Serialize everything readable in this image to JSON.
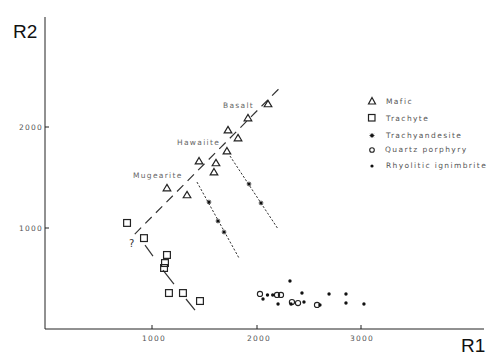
{
  "chart_data": {
    "type": "scatter",
    "title": "",
    "xlabel": "R1",
    "ylabel": "R2",
    "xlim": [
      0,
      3700
    ],
    "ylim": [
      0,
      2950
    ],
    "xticks": [
      1000,
      2000,
      3000
    ],
    "yticks": [
      1000,
      2000
    ],
    "xtick_labels": [
      "1000",
      "2000",
      "3000"
    ],
    "ytick_labels": [
      "1000",
      "2000"
    ],
    "grid": false,
    "legend_position": "upper right",
    "series": [
      {
        "name": "Mafic",
        "marker": "open-triangle",
        "points": [
          [
            2115,
            2228
          ],
          [
            1923,
            2089
          ],
          [
            1732,
            1970
          ],
          [
            1828,
            1891
          ],
          [
            1722,
            1762
          ],
          [
            1455,
            1663
          ],
          [
            1617,
            1644
          ],
          [
            1598,
            1554
          ],
          [
            1148,
            1396
          ],
          [
            1340,
            1327
          ]
        ]
      },
      {
        "name": "Trachyte",
        "marker": "open-square",
        "points": [
          [
            766,
            1050
          ],
          [
            928,
            900
          ],
          [
            1148,
            733
          ],
          [
            1129,
            653
          ],
          [
            1120,
            604
          ],
          [
            1167,
            356
          ],
          [
            1301,
            356
          ],
          [
            1464,
            277
          ]
        ]
      },
      {
        "name": "Trachyandesite",
        "marker": "star",
        "points": [
          [
            1550,
            1257
          ],
          [
            1636,
            1069
          ],
          [
            1694,
            960
          ],
          [
            1933,
            1436
          ],
          [
            2048,
            1248
          ]
        ]
      },
      {
        "name": "Quartz porphyry",
        "marker": "open-circle",
        "points": [
          [
            2038,
            347
          ],
          [
            2201,
            337
          ],
          [
            2239,
            337
          ],
          [
            2344,
            267
          ],
          [
            2402,
            257
          ],
          [
            2584,
            238
          ]
        ]
      },
      {
        "name": "Rhyolitic ignimbrite",
        "marker": "filled-dot",
        "points": [
          [
            2325,
            475
          ],
          [
            2067,
            297
          ],
          [
            2110,
            337
          ],
          [
            2160,
            337
          ],
          [
            2211,
            248
          ],
          [
            2440,
            356
          ],
          [
            2335,
            248
          ],
          [
            2459,
            267
          ],
          [
            2612,
            238
          ],
          [
            2699,
            347
          ],
          [
            2861,
            347
          ],
          [
            2861,
            257
          ],
          [
            3033,
            248
          ]
        ]
      }
    ],
    "trend_lines": [
      {
        "name": "mafic-trend",
        "style": "long-dash",
        "from": [
          840,
          940
        ],
        "to": [
          2230,
          2390
        ]
      },
      {
        "name": "trachyte-trend",
        "style": "long-dash-sparse",
        "segments": [
          [
            [
              938,
              830
            ],
            [
              1014,
              722
            ]
          ],
          [
            [
              1110,
              584
            ],
            [
              1215,
              445
            ]
          ],
          [
            [
              1330,
              297
            ],
            [
              1416,
              188
            ]
          ]
        ]
      },
      {
        "name": "trachyandesite-trend-left",
        "style": "dotted-dash",
        "from": [
          1435,
          1455
        ],
        "to": [
          1837,
          703
        ]
      },
      {
        "name": "trachyandesite-trend-right",
        "style": "dotted-dash",
        "from": [
          1751,
          1713
        ],
        "to": [
          2211,
          990
        ]
      }
    ],
    "annotations": [
      {
        "text": "Basalt",
        "at": [
          1684,
          2208
        ]
      },
      {
        "text": "Hawaiite",
        "at": [
          1244,
          1842
        ]
      },
      {
        "text": "Mugearite",
        "at": [
          833,
          1515
        ]
      },
      {
        "text": "?",
        "at": [
          815,
          832
        ]
      }
    ]
  },
  "axes": {
    "x_title": "R1",
    "y_title": "R2",
    "x_ticks": [
      "1000",
      "2000",
      "3000"
    ],
    "y_ticks": [
      "1000",
      "2000"
    ]
  },
  "legend": {
    "items": [
      {
        "label": "Mafic",
        "icon": "open-triangle-icon"
      },
      {
        "label": "Trachyte",
        "icon": "open-square-icon"
      },
      {
        "label": "Trachyandesite",
        "icon": "star-icon"
      },
      {
        "label": "Quartz porphyry",
        "icon": "open-circle-icon"
      },
      {
        "label": "Rhyolitic ignimbrite",
        "icon": "filled-dot-icon"
      }
    ]
  },
  "labels": {
    "basalt": "Basalt",
    "hawaiite": "Hawaiite",
    "mugearite": "Mugearite",
    "question": "?"
  }
}
